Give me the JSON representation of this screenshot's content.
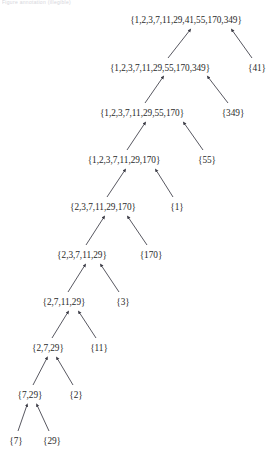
{
  "header": {
    "faint_text": "Figure annotation (illegible)"
  },
  "diagram": {
    "type": "hasse-lattice",
    "width": 278,
    "height": 461,
    "arrow_color": "#3a3a44",
    "text_color": "#2a2a2a",
    "background_color": "#ffffff",
    "nodes": [
      {
        "id": "n1",
        "label": "{1,2,3,7,11,29,41,55,170,349}",
        "cx": 186,
        "cy": 20
      },
      {
        "id": "n2",
        "label": "{1,2,3,7,11,29,55,170,349}",
        "cx": 160,
        "cy": 68
      },
      {
        "id": "s41",
        "label": "{41}",
        "cx": 257,
        "cy": 68
      },
      {
        "id": "n3",
        "label": "{1,2,3,7,11,29,55,170}",
        "cx": 142,
        "cy": 113
      },
      {
        "id": "s349",
        "label": "{349}",
        "cx": 233,
        "cy": 113
      },
      {
        "id": "n4",
        "label": "{1,2,3,7,11,29,170}",
        "cx": 124,
        "cy": 160
      },
      {
        "id": "s55",
        "label": "{55}",
        "cx": 207,
        "cy": 160
      },
      {
        "id": "n5",
        "label": "{2,3,7,11,29,170}",
        "cx": 103,
        "cy": 207
      },
      {
        "id": "s1",
        "label": "{1}",
        "cx": 177,
        "cy": 207
      },
      {
        "id": "n6",
        "label": "{2,3,7,11,29}",
        "cx": 82,
        "cy": 255
      },
      {
        "id": "s170",
        "label": "{170}",
        "cx": 151,
        "cy": 255
      },
      {
        "id": "n7",
        "label": "{2,7,11,29}",
        "cx": 64,
        "cy": 302
      },
      {
        "id": "s3",
        "label": "{3}",
        "cx": 123,
        "cy": 302
      },
      {
        "id": "n8",
        "label": "{2,7,29}",
        "cx": 48,
        "cy": 348
      },
      {
        "id": "s11",
        "label": "{11}",
        "cx": 99,
        "cy": 348
      },
      {
        "id": "n9",
        "label": "{7,29}",
        "cx": 30,
        "cy": 395
      },
      {
        "id": "s2",
        "label": "{2}",
        "cx": 76,
        "cy": 395
      },
      {
        "id": "s7",
        "label": "{7}",
        "cx": 16,
        "cy": 441
      },
      {
        "id": "s29",
        "label": "{29}",
        "cx": 52,
        "cy": 441
      }
    ],
    "edges": [
      {
        "from": "n2",
        "to": "n1",
        "x1": 168,
        "y1": 58,
        "x2": 190,
        "y2": 30
      },
      {
        "from": "s41",
        "to": "n1",
        "x1": 252,
        "y1": 58,
        "x2": 232,
        "y2": 30
      },
      {
        "from": "n3",
        "to": "n2",
        "x1": 145,
        "y1": 103,
        "x2": 163,
        "y2": 77
      },
      {
        "from": "s349",
        "to": "n2",
        "x1": 228,
        "y1": 103,
        "x2": 208,
        "y2": 77
      },
      {
        "from": "n4",
        "to": "n3",
        "x1": 127,
        "y1": 150,
        "x2": 145,
        "y2": 123
      },
      {
        "from": "s55",
        "to": "n3",
        "x1": 203,
        "y1": 150,
        "x2": 184,
        "y2": 123
      },
      {
        "from": "n5",
        "to": "n4",
        "x1": 107,
        "y1": 197,
        "x2": 125,
        "y2": 170
      },
      {
        "from": "s1",
        "to": "n4",
        "x1": 173,
        "y1": 197,
        "x2": 156,
        "y2": 170
      },
      {
        "from": "n6",
        "to": "n5",
        "x1": 86,
        "y1": 245,
        "x2": 104,
        "y2": 217
      },
      {
        "from": "s170",
        "to": "n5",
        "x1": 147,
        "y1": 245,
        "x2": 128,
        "y2": 217
      },
      {
        "from": "n7",
        "to": "n6",
        "x1": 68,
        "y1": 292,
        "x2": 85,
        "y2": 265
      },
      {
        "from": "s3",
        "to": "n6",
        "x1": 119,
        "y1": 292,
        "x2": 101,
        "y2": 265
      },
      {
        "from": "n8",
        "to": "n7",
        "x1": 52,
        "y1": 338,
        "x2": 68,
        "y2": 312
      },
      {
        "from": "s11",
        "to": "n7",
        "x1": 96,
        "y1": 338,
        "x2": 79,
        "y2": 312
      },
      {
        "from": "n9",
        "to": "n8",
        "x1": 33,
        "y1": 385,
        "x2": 47,
        "y2": 358
      },
      {
        "from": "s2",
        "to": "n8",
        "x1": 73,
        "y1": 385,
        "x2": 57,
        "y2": 358
      },
      {
        "from": "s7",
        "to": "n9",
        "x1": 18,
        "y1": 431,
        "x2": 27,
        "y2": 405
      },
      {
        "from": "s29",
        "to": "n9",
        "x1": 49,
        "y1": 431,
        "x2": 37,
        "y2": 405
      }
    ]
  }
}
